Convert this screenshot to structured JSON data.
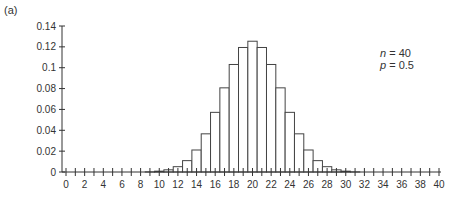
{
  "panel_label": "(a)",
  "annotation": {
    "n_var": "n",
    "n_value": " = 40",
    "p_var": "p",
    "p_value": " = 0.5"
  },
  "chart_data": {
    "type": "bar",
    "title": "",
    "xlabel": "",
    "ylabel": "",
    "xlim": [
      0,
      40
    ],
    "ylim": [
      0,
      0.14
    ],
    "grid": false,
    "legend": null,
    "annotations": [
      "n = 40",
      "p = 0.5"
    ],
    "x_ticks": [
      0,
      2,
      4,
      6,
      8,
      10,
      12,
      14,
      16,
      18,
      20,
      22,
      24,
      26,
      28,
      30,
      32,
      34,
      36,
      38,
      40
    ],
    "y_ticks": [
      0,
      0.02,
      0.04,
      0.06,
      0.08,
      0.1,
      0.12,
      0.14
    ],
    "y_tick_labels": [
      "0",
      "0.02",
      "0.04",
      "0.06",
      "0.08",
      "0.1",
      "0.12",
      "0.14"
    ],
    "categories": [
      0,
      1,
      2,
      3,
      4,
      5,
      6,
      7,
      8,
      9,
      10,
      11,
      12,
      13,
      14,
      15,
      16,
      17,
      18,
      19,
      20,
      21,
      22,
      23,
      24,
      25,
      26,
      27,
      28,
      29,
      30,
      31,
      32,
      33,
      34,
      35,
      36,
      37,
      38,
      39,
      40
    ],
    "values": [
      0,
      0,
      0,
      0,
      0,
      0,
      0,
      0,
      0,
      0.0001,
      0.0008,
      0.0021,
      0.0051,
      0.0109,
      0.0211,
      0.0366,
      0.0572,
      0.0807,
      0.1031,
      0.1194,
      0.1254,
      0.1194,
      0.1031,
      0.0807,
      0.0572,
      0.0366,
      0.0211,
      0.0109,
      0.0051,
      0.0021,
      0.0008,
      0.0001,
      0,
      0,
      0,
      0,
      0,
      0,
      0,
      0,
      0
    ]
  }
}
